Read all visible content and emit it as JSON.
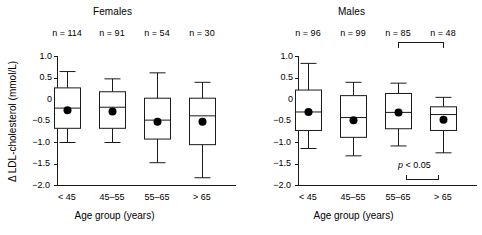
{
  "chart_data": {
    "type": "box",
    "title": "",
    "ylabel": "Δ LDL-cholesterol (mmol/L)",
    "xlabel": "Age group (years)",
    "ylim": [
      -2.0,
      1.0
    ],
    "yticks": [
      "1.0",
      "0.5",
      "0",
      "−0.5",
      "−1.0",
      "−1.5",
      "−2.0"
    ],
    "ytick_values": [
      1.0,
      0.5,
      0,
      -0.5,
      -1.0,
      -1.5,
      -2.0
    ],
    "categories": [
      "< 45",
      "45–55",
      "55–65",
      "> 65"
    ],
    "grid": false,
    "legend": "none",
    "marker_note": "filled circle = mean",
    "panels": [
      {
        "name": "females",
        "title": "Females",
        "xlabel": "Age group (years)",
        "boxes": [
          {
            "category": "< 45",
            "n_label": "n = 114",
            "n": 114,
            "whisker_low": -1.0,
            "q1": -0.67,
            "median": -0.2,
            "q3": 0.27,
            "whisker_high": 0.65,
            "mean": -0.25
          },
          {
            "category": "45–55",
            "n_label": "n = 91",
            "n": 91,
            "whisker_low": -1.0,
            "q1": -0.67,
            "median": -0.18,
            "q3": 0.18,
            "whisker_high": 0.48,
            "mean": -0.28
          },
          {
            "category": "55–65",
            "n_label": "n = 54",
            "n": 54,
            "whisker_low": -1.47,
            "q1": -0.92,
            "median": -0.48,
            "q3": 0.03,
            "whisker_high": 0.62,
            "mean": -0.52
          },
          {
            "category": "> 65",
            "n_label": "n = 30",
            "n": 30,
            "whisker_low": -1.82,
            "q1": -1.05,
            "median": -0.38,
            "q3": 0.03,
            "whisker_high": 0.4,
            "mean": -0.52
          }
        ],
        "significance": null
      },
      {
        "name": "males",
        "title": "Males",
        "xlabel": "Age group (years)",
        "boxes": [
          {
            "category": "< 45",
            "n_label": "n = 96",
            "n": 96,
            "whisker_low": -1.14,
            "q1": -0.72,
            "median": -0.29,
            "q3": 0.22,
            "whisker_high": 0.84,
            "mean": -0.29
          },
          {
            "category": "45–55",
            "n_label": "n = 99",
            "n": 99,
            "whisker_low": -1.31,
            "q1": -0.88,
            "median": -0.42,
            "q3": 0.09,
            "whisker_high": 0.4,
            "mean": -0.48
          },
          {
            "category": "55–65",
            "n_label": "n = 85",
            "n": 85,
            "whisker_low": -1.08,
            "q1": -0.68,
            "median": -0.3,
            "q3": 0.14,
            "whisker_high": 0.38,
            "mean": -0.3
          },
          {
            "category": "> 65",
            "n_label": "n = 48",
            "n": 48,
            "whisker_low": -1.24,
            "q1": -0.72,
            "median": -0.35,
            "q3": -0.17,
            "whisker_high": 0.05,
            "mean": -0.47
          }
        ],
        "significance": {
          "label_italic": "p",
          "label_rest": " < 0.05",
          "groups": [
            "55–65",
            "> 65"
          ]
        }
      }
    ]
  },
  "colors": {
    "stroke": "#1a1a1a",
    "background": "#ffffff",
    "marker": "#000000"
  }
}
